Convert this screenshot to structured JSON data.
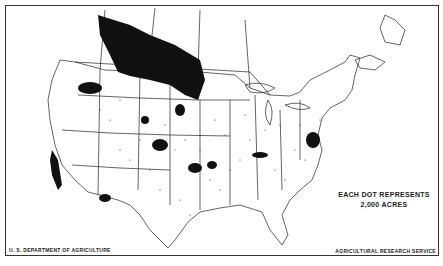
{
  "map": {
    "subject": "Dot-density map of North America (United States and southern Canada)",
    "legend": {
      "line1": "EACH DOT REPRESENTS",
      "line2": "2,000 ACRES"
    },
    "credits": {
      "left": "U. S. DEPARTMENT OF AGRICULTURE",
      "right": "AGRICULTURAL RESEARCH SERVICE"
    },
    "colors": {
      "ink": "#111111",
      "background": "#ffffff",
      "border": "#333333"
    },
    "dense_regions": [
      "Canadian Prairies (Alberta, Saskatchewan, Manitoba)",
      "Montana / North Dakota",
      "Eastern Washington (Palouse)",
      "California Central Valley",
      "Kansas / Oklahoma",
      "Pennsylvania / Maryland",
      "Ohio / Indiana"
    ]
  }
}
